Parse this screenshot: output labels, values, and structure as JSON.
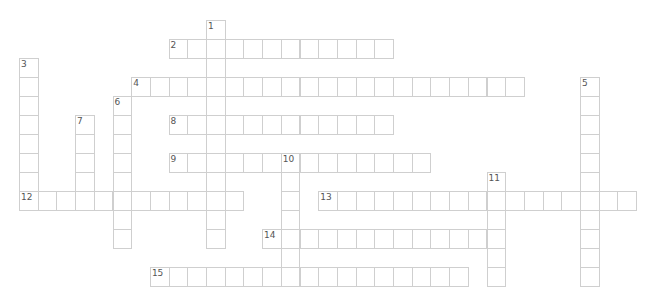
{
  "puzzle": {
    "type": "crossword",
    "cell_width": 18.7,
    "cell_height": 19,
    "origin_x": 19,
    "origin_y": 19.5,
    "line_color": "#cfcfcf",
    "number_color": "#555555"
  },
  "words": [
    {
      "number": "1",
      "direction": "down",
      "col": 10,
      "row": 0,
      "length": 12
    },
    {
      "number": "2",
      "direction": "across",
      "col": 8,
      "row": 1,
      "length": 12
    },
    {
      "number": "3",
      "direction": "down",
      "col": 0,
      "row": 2,
      "length": 8
    },
    {
      "number": "4",
      "direction": "across",
      "col": 6,
      "row": 3,
      "length": 21
    },
    {
      "number": "5",
      "direction": "down",
      "col": 30,
      "row": 3,
      "length": 11
    },
    {
      "number": "6",
      "direction": "down",
      "col": 5,
      "row": 4,
      "length": 8
    },
    {
      "number": "7",
      "direction": "down",
      "col": 3,
      "row": 5,
      "length": 5
    },
    {
      "number": "8",
      "direction": "across",
      "col": 8,
      "row": 5,
      "length": 12
    },
    {
      "number": "9",
      "direction": "across",
      "col": 8,
      "row": 7,
      "length": 14
    },
    {
      "number": "10",
      "direction": "down",
      "col": 14,
      "row": 7,
      "length": 7
    },
    {
      "number": "11",
      "direction": "down",
      "col": 25,
      "row": 8,
      "length": 6
    },
    {
      "number": "12",
      "direction": "across",
      "col": 0,
      "row": 9,
      "length": 12
    },
    {
      "number": "13",
      "direction": "across",
      "col": 16,
      "row": 9,
      "length": 17
    },
    {
      "number": "14",
      "direction": "across",
      "col": 13,
      "row": 11,
      "length": 13
    },
    {
      "number": "15",
      "direction": "across",
      "col": 7,
      "row": 13,
      "length": 17
    }
  ]
}
